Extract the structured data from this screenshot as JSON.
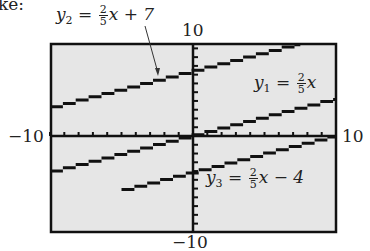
{
  "intro_text_fragment": "ke:",
  "chart_data": {
    "type": "line",
    "title": "",
    "xlabel": "",
    "ylabel": "",
    "xlim": [
      -10,
      10
    ],
    "ylim": [
      -10,
      10
    ],
    "tick_labels": {
      "x_min": "−10",
      "x_max": "10",
      "y_min": "−10",
      "y_max": "10"
    },
    "grid": false,
    "series": [
      {
        "name": "y1",
        "label": "y1 = (2/5)x",
        "slope": 0.4,
        "intercept": 0,
        "x": [
          -10,
          10
        ],
        "y": [
          -4,
          4
        ]
      },
      {
        "name": "y2",
        "label": "y2 = (2/5)x + 7",
        "slope": 0.4,
        "intercept": 7,
        "x": [
          -10,
          7.5
        ],
        "y": [
          3,
          10
        ]
      },
      {
        "name": "y3",
        "label": "y3 = (2/5)x − 4",
        "slope": 0.4,
        "intercept": -4,
        "x": [
          -5,
          10
        ],
        "y": [
          -6,
          0
        ]
      }
    ],
    "annotations": [
      {
        "text": "y2 = (2/5)x + 7",
        "arrow_to_series": "y2"
      },
      {
        "text": "y1 = (2/5)x"
      },
      {
        "text": "y3 = (2/5)x − 4"
      }
    ]
  },
  "labels": {
    "y2": {
      "var": "y",
      "sub": "2",
      "eq": " = ",
      "num": "2",
      "den": "5",
      "tail": "x + 7"
    },
    "y1": {
      "var": "y",
      "sub": "1",
      "eq": " = ",
      "num": "2",
      "den": "5",
      "tail": "x"
    },
    "y3": {
      "var": "y",
      "sub": "3",
      "eq": " = ",
      "num": "2",
      "den": "5",
      "tail": "x − 4"
    },
    "ymax": "10",
    "ymin": "−10",
    "xmin": "−10",
    "xmax": "10"
  },
  "colors": {
    "screen_bg": "#e6e6e6",
    "ink": "#111111"
  }
}
